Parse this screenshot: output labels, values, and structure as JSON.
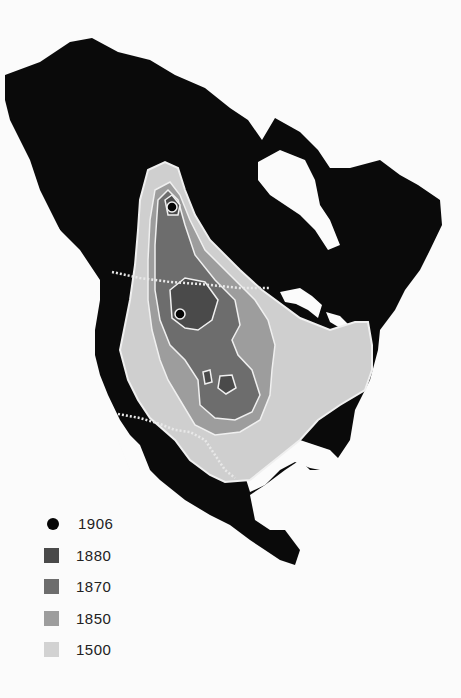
{
  "map": {
    "subject": "North America range map",
    "colors": {
      "land": "#0a0a0a",
      "water": "#fbfbfb",
      "range_1500": "#cfcfcf",
      "range_1850": "#9d9d9d",
      "range_1870": "#6d6d6d",
      "range_1880": "#4a4a4a",
      "range_1906": "#050505",
      "boundary": "#e8e8e8"
    }
  },
  "legend": {
    "items": [
      {
        "label": "1906",
        "symbol": "dot",
        "color": "#050505"
      },
      {
        "label": "1880",
        "symbol": "square",
        "color": "#4a4a4a"
      },
      {
        "label": "1870",
        "symbol": "square",
        "color": "#6d6d6d"
      },
      {
        "label": "1850",
        "symbol": "square",
        "color": "#9d9d9d"
      },
      {
        "label": "1500",
        "symbol": "square",
        "color": "#d2d2d2"
      }
    ]
  }
}
